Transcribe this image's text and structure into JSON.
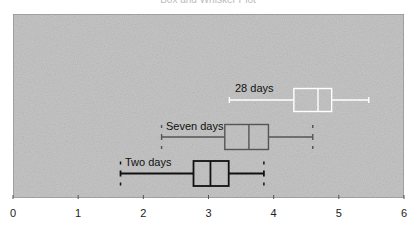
{
  "chart_data": {
    "type": "boxplot",
    "title": "Box and Whisker Plot",
    "xlabel": "",
    "ylabel": "",
    "xlim": [
      0,
      6
    ],
    "xticks": [
      0,
      1,
      2,
      3,
      4,
      5,
      6
    ],
    "grid": false,
    "legend": "none (labels placed beside each box)",
    "series": [
      {
        "name": "Two days",
        "min": 1.65,
        "q1": 2.77,
        "median": 3.03,
        "q3": 3.31,
        "max": 3.85,
        "color": "#111111"
      },
      {
        "name": "Seven days",
        "min": 2.28,
        "q1": 3.25,
        "median": 3.62,
        "q3": 3.92,
        "max": 4.6,
        "color": "#555555"
      },
      {
        "name": "28 days",
        "min": 3.32,
        "q1": 4.31,
        "median": 4.68,
        "q3": 4.89,
        "max": 5.46,
        "color": "#ffffff"
      }
    ]
  },
  "colors": {
    "plot_background": "#c6c6c6",
    "frame": "#888888"
  }
}
